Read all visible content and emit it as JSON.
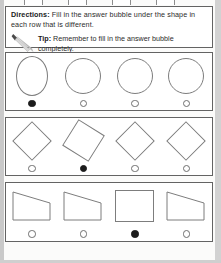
{
  "worksheet": {
    "directions": {
      "label": "Directions:",
      "text": " Fill in the answer bubble under the shape in each row that is different."
    },
    "tip": {
      "icon": "pencil-icon",
      "label": "Tip:",
      "text": " Remember to fill in the answer bubble completely."
    }
  },
  "rows": [
    {
      "name": "row-ovals-circles",
      "shapes": [
        {
          "kind": "oval",
          "bubble": "filled"
        },
        {
          "kind": "circle",
          "bubble": "empty"
        },
        {
          "kind": "circle",
          "bubble": "empty"
        },
        {
          "kind": "circle",
          "bubble": "empty"
        }
      ]
    },
    {
      "name": "row-diamonds",
      "shapes": [
        {
          "kind": "diamond",
          "bubble": "empty"
        },
        {
          "kind": "diamond-tilted",
          "bubble": "filled"
        },
        {
          "kind": "diamond",
          "bubble": "empty"
        },
        {
          "kind": "diamond",
          "bubble": "empty"
        }
      ]
    },
    {
      "name": "row-trapezoids",
      "shapes": [
        {
          "kind": "trapezoid",
          "bubble": "empty"
        },
        {
          "kind": "trapezoid",
          "bubble": "empty"
        },
        {
          "kind": "rectangle",
          "bubble": "filled"
        },
        {
          "kind": "trapezoid",
          "bubble": "empty"
        }
      ]
    }
  ],
  "colors": {
    "ink": "#2b2b2b",
    "shape_outline": "#7d7d7d",
    "box_border": "#636363",
    "bubble_filled": "#1c1c1c",
    "page": "#ffffff"
  }
}
